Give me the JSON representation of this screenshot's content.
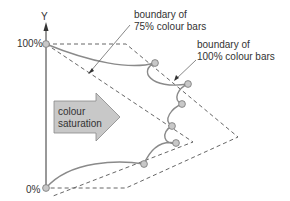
{
  "axis": {
    "label": "Y",
    "top_label": "100%",
    "bottom_label": "0%"
  },
  "arrow": {
    "line1": "colour",
    "line2": "saturation",
    "fill": "#c8c8c8"
  },
  "annotations": {
    "inner": {
      "line1": "boundary of",
      "line2": "75% colour bars"
    },
    "outer": {
      "line1": "boundary of",
      "line2": "100% colour bars"
    }
  },
  "colors": {
    "curve": "#8a8a8a",
    "point_fill": "#c8c8c8",
    "dash": "#555555"
  }
}
